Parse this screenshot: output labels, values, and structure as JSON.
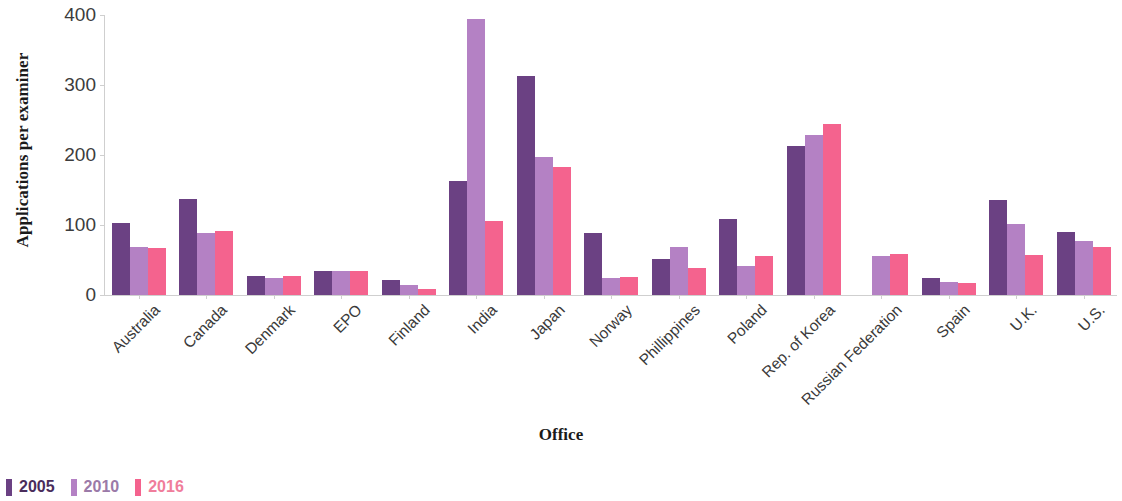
{
  "chart_data": {
    "type": "bar",
    "title": "",
    "xlabel": "Office",
    "ylabel": "Applications per examiner",
    "ylim": [
      0,
      400
    ],
    "yticks": [
      0,
      100,
      200,
      300,
      400
    ],
    "grid": false,
    "legend_position": "bottom-left",
    "categories": [
      "Australia",
      "Canada",
      "Denmark",
      "EPO",
      "Finland",
      "India",
      "Japan",
      "Norway",
      "Phillippines",
      "Poland",
      "Rep. of Korea",
      "Russian Federation",
      "Spain",
      "U.K.",
      "U.S."
    ],
    "series": [
      {
        "name": "2005",
        "color": "#6B4183",
        "values": [
          103,
          137,
          27,
          35,
          21,
          163,
          313,
          88,
          52,
          108,
          213,
          null,
          25,
          136,
          90
        ]
      },
      {
        "name": "2010",
        "color": "#B481C4",
        "values": [
          69,
          88,
          25,
          35,
          14,
          395,
          197,
          24,
          68,
          41,
          228,
          56,
          18,
          101,
          77
        ]
      },
      {
        "name": "2016",
        "color": "#F4638E",
        "values": [
          67,
          91,
          27,
          35,
          9,
          106,
          183,
          26,
          39,
          56,
          244,
          58,
          17,
          57,
          69
        ]
      }
    ]
  },
  "legend": {
    "items": [
      {
        "label": "2005",
        "color": "#6B4183",
        "text_color": "#4a2d5c"
      },
      {
        "label": "2010",
        "color": "#B481C4",
        "text_color": "#9b7aa8"
      },
      {
        "label": "2016",
        "color": "#F4638E",
        "text_color": "#f07d9b"
      }
    ]
  },
  "axes": {
    "y_title": "Applications per examiner",
    "x_title": "Office"
  }
}
